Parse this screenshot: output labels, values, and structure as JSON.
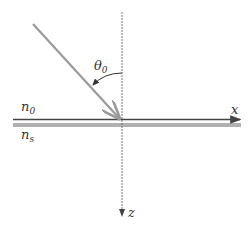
{
  "diagram": {
    "type": "oblique incidence geometry",
    "labels": {
      "ambient_index": "n",
      "ambient_index_sub": "0",
      "substrate_index": "n",
      "substrate_index_sub": "s",
      "angle": "θ",
      "angle_sub": "0",
      "x_axis": "x",
      "z_axis": "z"
    },
    "colors": {
      "ray": "#9a9a9a",
      "axis": "#555555",
      "interface": "#444444",
      "substrate": "#b0b0b0",
      "text": "#333333"
    }
  }
}
